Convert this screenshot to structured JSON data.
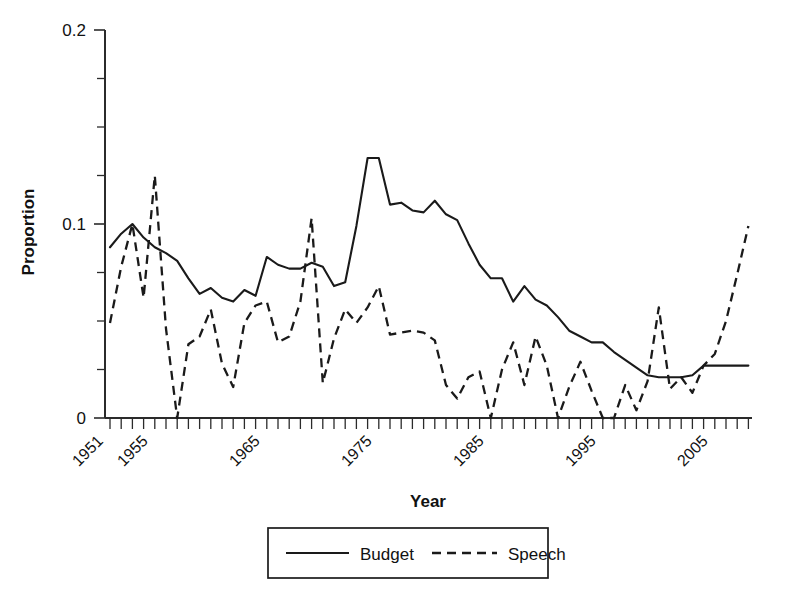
{
  "chart_data": {
    "type": "line",
    "title": "",
    "xlabel": "Year",
    "ylabel": "Proportion",
    "xlim": [
      1951,
      2008
    ],
    "ylim": [
      0,
      0.2
    ],
    "grid": false,
    "legend_position": "bottom-center",
    "ytick_labels": [
      "0",
      "0.1",
      "0.2"
    ],
    "ytick_values": [
      0,
      0.1,
      0.2
    ],
    "yminor_step": 0.025,
    "xtick_labels": [
      "1951",
      "1955",
      "1965",
      "1975",
      "1985",
      "1995",
      "2005"
    ],
    "xtick_values": [
      1951,
      1955,
      1965,
      1975,
      1985,
      1995,
      2005
    ],
    "xminor_step": 1,
    "x": [
      1951,
      1952,
      1953,
      1954,
      1955,
      1956,
      1957,
      1958,
      1959,
      1960,
      1961,
      1962,
      1963,
      1964,
      1965,
      1966,
      1967,
      1968,
      1969,
      1970,
      1971,
      1972,
      1973,
      1974,
      1975,
      1976,
      1977,
      1978,
      1979,
      1980,
      1981,
      1982,
      1983,
      1984,
      1985,
      1986,
      1987,
      1988,
      1989,
      1990,
      1991,
      1992,
      1993,
      1994,
      1995,
      1996,
      1997,
      1998,
      1999,
      2000,
      2001,
      2002,
      2003,
      2004,
      2005,
      2006,
      2007,
      2008
    ],
    "series": [
      {
        "name": "Budget",
        "style": "solid",
        "values": [
          0.088,
          0.095,
          0.1,
          0.093,
          0.088,
          0.085,
          0.081,
          0.072,
          0.064,
          0.067,
          0.062,
          0.06,
          0.066,
          0.063,
          0.083,
          0.079,
          0.077,
          0.077,
          0.08,
          0.078,
          0.068,
          0.07,
          0.099,
          0.134,
          0.134,
          0.11,
          0.111,
          0.107,
          0.106,
          0.112,
          0.105,
          0.102,
          0.09,
          0.079,
          0.072,
          0.072,
          0.06,
          0.068,
          0.061,
          0.058,
          0.052,
          0.045,
          0.042,
          0.039,
          0.039,
          0.034,
          0.03,
          0.026,
          0.022,
          0.021,
          0.021,
          0.021,
          0.022,
          0.027,
          0.027,
          0.027,
          0.027,
          0.027
        ]
      },
      {
        "name": "Speech",
        "style": "dashed",
        "values": [
          0.049,
          0.078,
          0.1,
          0.062,
          0.125,
          0.046,
          0.0,
          0.038,
          0.042,
          0.056,
          0.028,
          0.016,
          0.049,
          0.058,
          0.06,
          0.039,
          0.042,
          0.06,
          0.103,
          0.018,
          0.041,
          0.056,
          0.049,
          0.057,
          0.068,
          0.043,
          0.044,
          0.045,
          0.044,
          0.04,
          0.017,
          0.01,
          0.021,
          0.024,
          0.0,
          0.025,
          0.039,
          0.017,
          0.042,
          0.027,
          0.0,
          0.016,
          0.029,
          0.014,
          0.0,
          0.0,
          0.017,
          0.004,
          0.019,
          0.057,
          0.015,
          0.021,
          0.013,
          0.027,
          0.033,
          0.05,
          0.074,
          0.099
        ]
      }
    ]
  },
  "legend": {
    "items": [
      {
        "label": "Budget",
        "style": "solid"
      },
      {
        "label": "Speech",
        "style": "dashed"
      }
    ]
  }
}
